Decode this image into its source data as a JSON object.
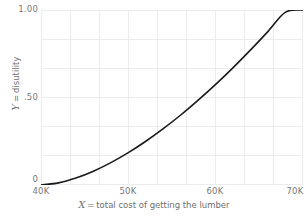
{
  "chart_data": {
    "type": "line",
    "title": "",
    "subtitle": "",
    "xlabel_var": "X",
    "xlabel_eq": "=",
    "xlabel_text": "total cost of getting the lumber",
    "ylabel_var": "Y",
    "ylabel_eq": "=",
    "ylabel_text": "disutility",
    "xlim": [
      40000,
      70000
    ],
    "ylim": [
      0,
      1.0
    ],
    "xticks": [
      40000,
      50000,
      60000,
      70000
    ],
    "xtick_labels": [
      "40K",
      "50K",
      "60K",
      "70K"
    ],
    "yticks": [
      0,
      0.5,
      1.0
    ],
    "ytick_labels": [
      "0",
      ".50",
      "1.00"
    ],
    "grid": true,
    "grid_color": "#e9e9ec",
    "legend": "none",
    "line_color": "#1a1a1a",
    "line_width": 1.6,
    "background": "#ffffff",
    "series": [
      {
        "name": "disutility",
        "x": [
          40000,
          42000,
          44000,
          46000,
          48000,
          50000,
          52000,
          54000,
          56000,
          58000,
          60000,
          62000,
          64000,
          66000,
          68000,
          70000
        ],
        "y": [
          0.0,
          0.012,
          0.04,
          0.079,
          0.128,
          0.185,
          0.25,
          0.322,
          0.4,
          0.485,
          0.575,
          0.671,
          0.772,
          0.878,
          0.988,
          1.0
        ]
      }
    ]
  },
  "axes": {
    "y_ticks": [
      {
        "label": "1.00",
        "value": 1.0
      },
      {
        "label": ".50",
        "value": 0.5
      },
      {
        "label": "0",
        "value": 0.0
      }
    ],
    "x_ticks": [
      {
        "label": "40K",
        "value": 40000
      },
      {
        "label": "50K",
        "value": 50000
      },
      {
        "label": "60K",
        "value": 60000
      },
      {
        "label": "70K",
        "value": 70000
      }
    ]
  }
}
